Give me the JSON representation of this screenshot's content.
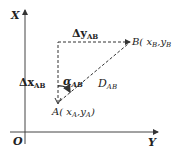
{
  "diagram": {
    "axes": {
      "vertical_label": "X",
      "horizontal_label": "Y",
      "origin_label": "O"
    },
    "points": {
      "A": {
        "name": "A",
        "coords": "( x",
        "sub1": "A",
        "sep": ",y",
        "sub2": "A",
        "close": ")"
      },
      "B": {
        "name": "B",
        "coords": "( x",
        "sub1": "B",
        "sep": ",y",
        "sub2": "B",
        "close": ""
      }
    },
    "labels": {
      "delta_y": {
        "main": "Δy",
        "sub": "AB"
      },
      "delta_x": {
        "main": "Δx",
        "sub": "AB"
      },
      "alpha": {
        "main": "α",
        "sub": "AB"
      },
      "distance": {
        "main": "D",
        "sub": "AB"
      }
    },
    "colors": {
      "line": "#333333",
      "text": "#222222",
      "background": "#ffffff"
    }
  }
}
